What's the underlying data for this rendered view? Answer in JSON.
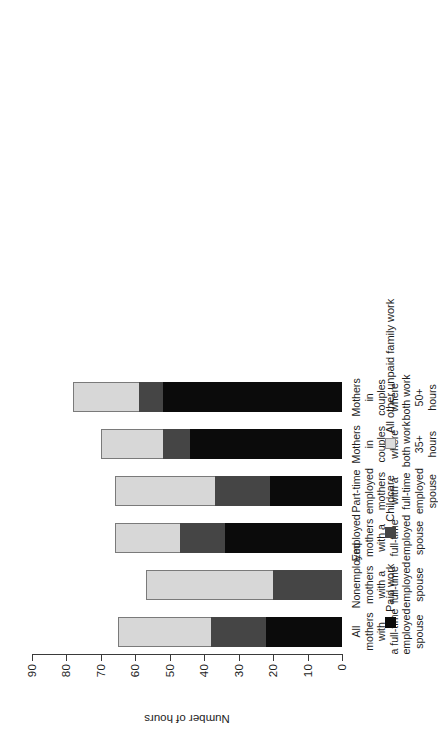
{
  "chart_data": {
    "type": "bar",
    "subtype": "stacked-horizontal-rotated",
    "title": "",
    "xlabel": "",
    "ylabel": "Number of hours",
    "ylim": [
      0,
      90
    ],
    "yticks": [
      "0",
      "10",
      "20",
      "30",
      "40",
      "50",
      "60",
      "70",
      "80",
      "90"
    ],
    "grid": false,
    "legend_position": "bottom",
    "categories": [
      "All mothers with a full-time employed spouse",
      "Nonemployed mothers with a full-time employed spouse",
      "Employed mothers with a full-time employed spouse",
      "Part-time employed mothers with a full-time employed spouse",
      "Mothers in couples where both work 35+ hours",
      "Mothers in couples where both work 50+ hours"
    ],
    "series": [
      {
        "name": "Paid work",
        "color": "#0b0b0b",
        "values": [
          22,
          0,
          34,
          21,
          44,
          52
        ]
      },
      {
        "name": "Childcare",
        "color": "#454545",
        "values": [
          16,
          20,
          13,
          16,
          8,
          7
        ]
      },
      {
        "name": "All other unpaid family work",
        "color": "#d7d7d7",
        "values": [
          27,
          37,
          19,
          29,
          18,
          19
        ]
      }
    ],
    "totals": [
      65,
      57,
      66,
      66,
      70,
      78
    ]
  },
  "axis": {
    "value_axis_title": "Number of hours"
  },
  "categories_wrapped": [
    [
      "All mothers with",
      "a full-time",
      "employed",
      "spouse"
    ],
    [
      "Nonemployed",
      "mothers with a",
      "full-time employed",
      "spouse"
    ],
    [
      "Employed mothers",
      "with a full-time",
      "employed spouse"
    ],
    [
      "Part-time",
      "employed mothers",
      "with a full-time",
      "employed spouse"
    ],
    [
      "Mothers in",
      "couples where",
      "both work 35+",
      "hours"
    ],
    [
      "Mothers in",
      "couples where",
      "both work 50+",
      "hours"
    ]
  ],
  "legend": {
    "items": [
      {
        "label": "Paid work",
        "color": "#0b0b0b"
      },
      {
        "label": "Childcare",
        "color": "#454545"
      },
      {
        "label": "All other unpaid family work",
        "color": "#d7d7d7"
      }
    ]
  }
}
